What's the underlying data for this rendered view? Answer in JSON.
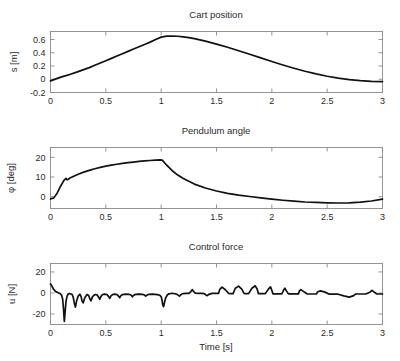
{
  "figure": {
    "background": "#ffffff",
    "line_color": "#111111",
    "axis_color": "#8a8a8a"
  },
  "chart_data": [
    {
      "type": "line",
      "title": "Cart position",
      "xlabel": "",
      "ylabel": "s [m]",
      "xlim": [
        0,
        3
      ],
      "ylim": [
        -0.2,
        0.72
      ],
      "xticks": [
        0,
        0.5,
        1,
        1.5,
        2,
        2.5,
        3
      ],
      "xticklabels": [
        "0",
        "0.5",
        "1",
        "1.5",
        "2",
        "2.5",
        "3"
      ],
      "yticks": [
        -0.2,
        0,
        0.2,
        0.4,
        0.6
      ],
      "yticklabels": [
        "-0.2",
        "0",
        "0.2",
        "0.4",
        "0.6"
      ],
      "grid": false,
      "legend": "none",
      "series": [
        {
          "name": "s",
          "x": [
            0.0,
            0.05,
            0.1,
            0.14,
            0.18,
            0.25,
            0.3,
            0.35,
            0.4,
            0.45,
            0.5,
            0.55,
            0.6,
            0.65,
            0.7,
            0.75,
            0.8,
            0.85,
            0.9,
            0.95,
            1.0,
            1.05,
            1.1,
            1.15,
            1.2,
            1.25,
            1.3,
            1.35,
            1.4,
            1.5,
            1.6,
            1.7,
            1.8,
            1.9,
            2.0,
            2.1,
            2.2,
            2.3,
            2.4,
            2.5,
            2.6,
            2.7,
            2.8,
            2.9,
            3.0
          ],
          "y": [
            -0.025,
            0.005,
            0.035,
            0.055,
            0.075,
            0.115,
            0.145,
            0.175,
            0.21,
            0.245,
            0.28,
            0.315,
            0.35,
            0.385,
            0.42,
            0.455,
            0.49,
            0.525,
            0.56,
            0.6,
            0.635,
            0.65,
            0.652,
            0.648,
            0.64,
            0.628,
            0.612,
            0.594,
            0.574,
            0.53,
            0.482,
            0.43,
            0.376,
            0.322,
            0.268,
            0.215,
            0.166,
            0.12,
            0.08,
            0.045,
            0.016,
            -0.006,
            -0.022,
            -0.032,
            -0.036
          ]
        }
      ]
    },
    {
      "type": "line",
      "title": "Pendulum angle",
      "xlabel": "",
      "ylabel": "φ [deg]",
      "xlim": [
        0,
        3
      ],
      "ylim": [
        -6,
        25
      ],
      "xticks": [
        0,
        0.5,
        1,
        1.5,
        2,
        2.5,
        3
      ],
      "xticklabels": [
        "0",
        "0.5",
        "1",
        "1.5",
        "2",
        "2.5",
        "3"
      ],
      "yticks": [
        0,
        10,
        20
      ],
      "yticklabels": [
        "0",
        "10",
        "20"
      ],
      "grid": false,
      "legend": "none",
      "series": [
        {
          "name": "phi",
          "x": [
            0.0,
            0.03,
            0.06,
            0.09,
            0.12,
            0.14,
            0.15,
            0.16,
            0.18,
            0.21,
            0.25,
            0.3,
            0.35,
            0.4,
            0.45,
            0.5,
            0.55,
            0.6,
            0.65,
            0.7,
            0.75,
            0.8,
            0.85,
            0.9,
            0.95,
            0.99,
            1.01,
            1.05,
            1.1,
            1.15,
            1.2,
            1.3,
            1.4,
            1.5,
            1.6,
            1.7,
            1.8,
            1.9,
            2.0,
            2.1,
            2.2,
            2.3,
            2.4,
            2.5,
            2.6,
            2.7,
            2.8,
            2.9,
            3.0
          ],
          "y": [
            -1.2,
            -0.6,
            1.8,
            5.2,
            8.2,
            9.3,
            8.6,
            8.9,
            9.6,
            10.4,
            11.4,
            12.5,
            13.4,
            14.2,
            14.9,
            15.5,
            16.0,
            16.5,
            16.9,
            17.3,
            17.6,
            17.9,
            18.2,
            18.4,
            18.6,
            18.7,
            18.6,
            16.0,
            13.2,
            11.0,
            9.2,
            6.4,
            4.4,
            2.9,
            1.7,
            0.8,
            0.1,
            -0.6,
            -1.2,
            -1.8,
            -2.3,
            -2.7,
            -2.9,
            -3.1,
            -3.2,
            -3.1,
            -2.8,
            -2.2,
            -1.2
          ]
        }
      ]
    },
    {
      "type": "line",
      "title": "Control force",
      "xlabel": "Time [s]",
      "ylabel": "u [N]",
      "xlim": [
        0,
        3
      ],
      "ylim": [
        -30,
        28
      ],
      "xticks": [
        0,
        0.5,
        1,
        1.5,
        2,
        2.5,
        3
      ],
      "xticklabels": [
        "0",
        "0.5",
        "1",
        "1.5",
        "2",
        "2.5",
        "3"
      ],
      "yticks": [
        -20,
        0,
        20
      ],
      "yticklabels": [
        "-20",
        "0",
        "20"
      ],
      "grid": false,
      "legend": "none",
      "series": [
        {
          "name": "u",
          "x": [
            0.0,
            0.01,
            0.025,
            0.045,
            0.065,
            0.085,
            0.1,
            0.11,
            0.118,
            0.125,
            0.132,
            0.14,
            0.15,
            0.16,
            0.17,
            0.18,
            0.195,
            0.205,
            0.215,
            0.225,
            0.235,
            0.25,
            0.265,
            0.275,
            0.285,
            0.295,
            0.31,
            0.33,
            0.345,
            0.355,
            0.365,
            0.38,
            0.4,
            0.42,
            0.435,
            0.445,
            0.455,
            0.47,
            0.49,
            0.51,
            0.525,
            0.535,
            0.545,
            0.56,
            0.58,
            0.6,
            0.615,
            0.625,
            0.635,
            0.65,
            0.68,
            0.71,
            0.73,
            0.74,
            0.75,
            0.77,
            0.8,
            0.83,
            0.85,
            0.86,
            0.87,
            0.89,
            0.92,
            0.95,
            0.975,
            0.99,
            1.0,
            1.008,
            1.015,
            1.022,
            1.03,
            1.04,
            1.055,
            1.07,
            1.09,
            1.11,
            1.13,
            1.15,
            1.165,
            1.175,
            1.185,
            1.2,
            1.225,
            1.25,
            1.27,
            1.282,
            1.292,
            1.31,
            1.34,
            1.37,
            1.39,
            1.4,
            1.412,
            1.43,
            1.46,
            1.49,
            1.508,
            1.518,
            1.53,
            1.55,
            1.58,
            1.61,
            1.628,
            1.638,
            1.65,
            1.67,
            1.7,
            1.73,
            1.748,
            1.758,
            1.77,
            1.79,
            1.82,
            1.85,
            1.868,
            1.878,
            1.89,
            1.91,
            1.94,
            1.97,
            1.988,
            1.998,
            2.01,
            2.03,
            2.06,
            2.09,
            2.108,
            2.118,
            2.13,
            2.15,
            2.185,
            2.22,
            2.24,
            2.25,
            2.262,
            2.285,
            2.32,
            2.36,
            2.39,
            2.402,
            2.415,
            2.44,
            2.48,
            2.52,
            2.545,
            2.557,
            2.57,
            2.6,
            2.65,
            2.7,
            2.74,
            2.755,
            2.77,
            2.8,
            2.85,
            2.89,
            2.905,
            2.92,
            2.95,
            3.0
          ],
          "y": [
            8.5,
            7.0,
            4.0,
            1.5,
            0.5,
            -0.5,
            -2.0,
            -6.0,
            -16.0,
            -27.0,
            -18.0,
            -8.0,
            -3.0,
            -1.0,
            -0.5,
            -0.8,
            -1.5,
            -4.0,
            -9.5,
            -13.5,
            -8.0,
            -3.0,
            -1.2,
            -3.0,
            -7.5,
            -9.5,
            -4.5,
            -1.5,
            -2.5,
            -5.5,
            -7.5,
            -3.5,
            -1.5,
            -1.8,
            -4.0,
            -6.0,
            -3.5,
            -1.5,
            -1.2,
            -1.5,
            -3.5,
            -5.2,
            -3.0,
            -1.5,
            -1.2,
            -1.5,
            -3.0,
            -4.5,
            -2.8,
            -1.5,
            -1.2,
            -1.3,
            -2.2,
            -3.6,
            -2.4,
            -1.3,
            -1.2,
            -1.3,
            -2.0,
            -3.0,
            -2.2,
            -1.3,
            -1.2,
            -1.3,
            -1.8,
            -2.5,
            -3.5,
            -7.0,
            -11.5,
            -13.0,
            -9.0,
            -5.0,
            -2.0,
            -0.8,
            -0.5,
            -0.5,
            -0.8,
            -1.8,
            -3.0,
            -2.0,
            -1.0,
            -0.6,
            -0.5,
            -0.5,
            1.5,
            3.2,
            1.5,
            -0.3,
            -0.5,
            -0.5,
            -0.6,
            -1.6,
            -2.6,
            -1.4,
            -0.4,
            -0.5,
            -0.5,
            -0.5,
            3.5,
            5.5,
            3.0,
            -0.5,
            -0.6,
            -0.6,
            -0.6,
            4.5,
            6.5,
            3.5,
            -0.5,
            -0.6,
            -0.6,
            -0.6,
            4.5,
            6.8,
            3.5,
            -0.6,
            -0.7,
            -0.7,
            -0.7,
            3.8,
            5.8,
            3.0,
            -0.8,
            -0.8,
            -0.8,
            -0.8,
            3.0,
            4.5,
            2.2,
            -0.9,
            -0.9,
            -0.9,
            -0.9,
            2.0,
            3.2,
            1.5,
            -1.0,
            -1.0,
            -1.0,
            -1.0,
            1.2,
            2.0,
            0.8,
            -1.2,
            -1.2,
            -1.2,
            -1.2,
            -1.2,
            -2.8,
            -4.0,
            -2.5,
            -1.2,
            -1.0,
            -1.0,
            -1.0,
            1.0,
            2.5,
            1.2,
            -1.0,
            -1.0,
            -1.2
          ]
        }
      ]
    }
  ]
}
